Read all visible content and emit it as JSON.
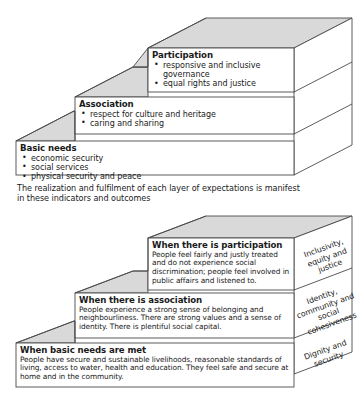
{
  "figure": {
    "caption": "The realization and fulfilment of each layer of expectations is manifest in these indicators and outcomes",
    "colors": {
      "outline": "#4a4a4a",
      "top_face": "#d9d9d9",
      "front_face": "#ffffff",
      "text": "#1a1a1a"
    }
  },
  "top_diagram": {
    "name": "layers-of-expectations-staircase",
    "steps": [
      {
        "id": "participation",
        "title": "Participation",
        "bullets": [
          "responsive and inclusive governance",
          "equal rights and justice"
        ]
      },
      {
        "id": "association",
        "title": "Association",
        "bullets": [
          "respect for culture and heritage",
          "caring and sharing"
        ]
      },
      {
        "id": "basic-needs",
        "title": "Basic needs",
        "bullets": [
          "economic security",
          "social services",
          "physical security and peace"
        ]
      }
    ]
  },
  "bottom_diagram": {
    "name": "indicators-and-outcomes-staircase",
    "steps": [
      {
        "id": "participation",
        "title": "When there is participation",
        "body": "People feel fairly and justly treated and do not experience social discrimination; people feel involved in public affairs and listened to.",
        "outcome": "Inclusivity, equity and justice"
      },
      {
        "id": "association",
        "title": "When there is association",
        "body": "People experience a strong sense of belonging and neighbourliness. There are strong values and a sense of identity. There is plentiful social capital.",
        "outcome": "Identity, community and social cohesiveness"
      },
      {
        "id": "basic-needs",
        "title": "When basic needs are met",
        "body": "People have secure and sustainable livelihoods, reasonable standards of living, access to water, health and education. They feel safe and secure at home and in the community.",
        "outcome": "Dignity and security"
      }
    ]
  }
}
